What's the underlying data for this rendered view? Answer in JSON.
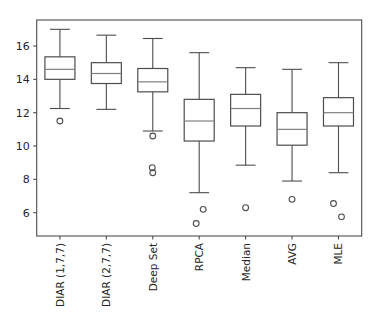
{
  "figure": {
    "background_color": "#ffffff",
    "axes_color": "#4d4d4d",
    "box_edge_color": "#4d4d4d",
    "median_color": "#808080",
    "outlier_color": "#4d4d4d",
    "tick_text_color": "#262626"
  },
  "chart_data": {
    "type": "box",
    "title": "",
    "xlabel": "",
    "ylabel": "",
    "ylim": [
      5.0,
      17.3
    ],
    "xlim": [
      0.5,
      7.5
    ],
    "grid": false,
    "legend": null,
    "yticks": [
      6,
      8,
      10,
      12,
      14,
      16
    ],
    "ytick_labels": [
      "6",
      "8",
      "10",
      "12",
      "14",
      "16"
    ],
    "categories": [
      "DIAR (1,7,7)",
      "DIAR (2,7,7)",
      "Deep Set",
      "RPCA",
      "Median",
      "AVG",
      "MLE"
    ],
    "boxes": [
      {
        "label": "DIAR (1,7,7)",
        "whisker_high": 17.0,
        "q3": 15.35,
        "median": 14.6,
        "q1": 14.0,
        "whisker_low": 12.25,
        "outliers": [
          11.5
        ]
      },
      {
        "label": "DIAR (2,7,7)",
        "whisker_high": 16.65,
        "q3": 15.0,
        "median": 14.35,
        "q1": 13.75,
        "whisker_low": 12.2,
        "outliers": []
      },
      {
        "label": "Deep Set",
        "whisker_high": 16.45,
        "q3": 14.65,
        "median": 13.85,
        "q1": 13.25,
        "whisker_low": 10.9,
        "outliers": [
          10.6,
          8.7,
          8.4
        ]
      },
      {
        "label": "RPCA",
        "whisker_high": 15.6,
        "q3": 12.8,
        "median": 11.5,
        "q1": 10.3,
        "whisker_low": 7.2,
        "outliers": [
          6.2,
          5.35
        ]
      },
      {
        "label": "Median",
        "whisker_high": 14.7,
        "q3": 13.1,
        "median": 12.25,
        "q1": 11.2,
        "whisker_low": 8.85,
        "outliers": [
          6.3
        ]
      },
      {
        "label": "AVG",
        "whisker_high": 14.6,
        "q3": 12.0,
        "median": 11.0,
        "q1": 10.05,
        "whisker_low": 7.9,
        "outliers": [
          6.8
        ]
      },
      {
        "label": "MLE",
        "whisker_high": 15.0,
        "q3": 12.9,
        "median": 12.0,
        "q1": 11.2,
        "whisker_low": 8.4,
        "outliers": [
          6.55,
          5.75
        ]
      }
    ],
    "outlier_x_offsets": {
      "DIAR (1,7,7)": [
        0
      ],
      "Deep Set": [
        0,
        -0.5,
        0
      ],
      "RPCA": [
        4,
        -3
      ],
      "Median": [
        0
      ],
      "AVG": [
        0
      ],
      "MLE": [
        -5,
        3
      ]
    }
  }
}
